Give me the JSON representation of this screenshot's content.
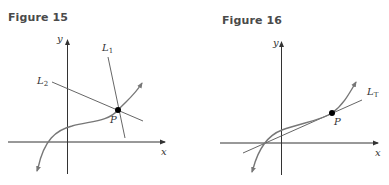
{
  "figures": [
    {
      "title": "Figure 15",
      "labels": {
        "y_axis": "y",
        "x_axis": "x",
        "point": "P",
        "line1": "L",
        "line1_sub": "1",
        "line2": "L",
        "line2_sub": "2"
      },
      "description": "Cubic-like curve with point P; two secant/normal lines L1 and L2 intersect at P"
    },
    {
      "title": "Figure 16",
      "labels": {
        "y_axis": "y",
        "x_axis": "x",
        "point": "P",
        "tangent": "L",
        "tangent_sub": "T"
      },
      "description": "Cubic-like curve with tangent line LT touching the curve at point P"
    }
  ],
  "colors": {
    "axis": "#333333",
    "curve": "#777777",
    "line": "#555555",
    "point": "#000000",
    "title": "#4a4a4a"
  }
}
